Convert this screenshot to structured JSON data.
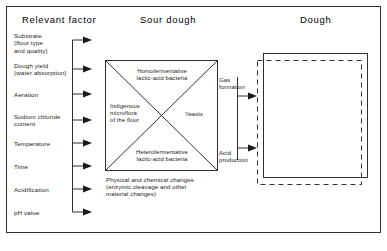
{
  "figure": {
    "title_columns": [
      {
        "label": "Relevant factor"
      },
      {
        "label": "Sour dough"
      },
      {
        "label": "Dough"
      }
    ],
    "relevant_factors": [
      {
        "label": "Substrate\n(flour type\nand quality)"
      },
      {
        "label": "Dough yield\n(water absorption)"
      },
      {
        "label": "Aeration"
      },
      {
        "label": "Sodium chloride\ncontent"
      },
      {
        "label": "Temperature"
      },
      {
        "label": "Time"
      },
      {
        "label": "Acidification"
      },
      {
        "label": "pH value"
      }
    ],
    "sour_dough": {
      "quadrants": {
        "top": "Homofermentative\nlactic-acid bacteria",
        "left": "Indigenous\nmicroflora\nof the flour",
        "right": "Yeasts",
        "bottom": "Heterofermentative\nlactic-acid bacteria"
      },
      "caption": "Physical and chemical changes\n(enzymic cleavage and other\nmaterial changes)"
    },
    "flows": [
      {
        "label": "Gas\nformation"
      },
      {
        "label": "Acid\nproduction"
      }
    ],
    "colors": {
      "line": "#1a1a1a",
      "text": "#1a1a1a",
      "background": "#ffffff"
    }
  }
}
